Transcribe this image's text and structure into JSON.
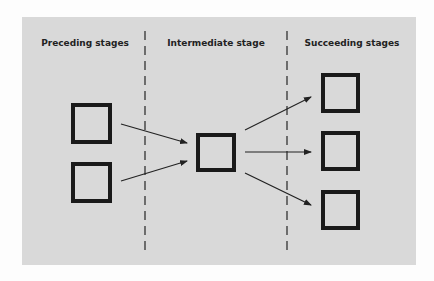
{
  "diagram": {
    "background_color": "#d9d9d9",
    "stages": [
      {
        "label": "Preceding stages",
        "center_x": 85
      },
      {
        "label": "Intermediate stage",
        "center_x": 216
      },
      {
        "label": "Succeeding stages",
        "center_x": 352
      }
    ],
    "dividers": [
      {
        "x": 145
      },
      {
        "x": 287
      }
    ],
    "boxes": [
      {
        "id": "preceding-1",
        "x": 71,
        "y": 103,
        "w": 41,
        "h": 41
      },
      {
        "id": "preceding-2",
        "x": 71,
        "y": 162,
        "w": 41,
        "h": 41
      },
      {
        "id": "intermediate",
        "x": 196,
        "y": 133,
        "w": 40,
        "h": 39
      },
      {
        "id": "succeeding-1",
        "x": 321,
        "y": 73,
        "w": 39,
        "h": 40
      },
      {
        "id": "succeeding-2",
        "x": 321,
        "y": 131,
        "w": 39,
        "h": 40
      },
      {
        "id": "succeeding-3",
        "x": 321,
        "y": 190,
        "w": 39,
        "h": 40
      }
    ],
    "arrows": [
      {
        "from": "preceding-1",
        "to": "intermediate",
        "x1": 121,
        "y1": 124,
        "x2": 187,
        "y2": 143
      },
      {
        "from": "preceding-2",
        "to": "intermediate",
        "x1": 121,
        "y1": 181,
        "x2": 187,
        "y2": 161
      },
      {
        "from": "intermediate",
        "to": "succeeding-1",
        "x1": 245,
        "y1": 130,
        "x2": 311,
        "y2": 97
      },
      {
        "from": "intermediate",
        "to": "succeeding-2",
        "x1": 245,
        "y1": 152,
        "x2": 311,
        "y2": 152
      },
      {
        "from": "intermediate",
        "to": "succeeding-3",
        "x1": 245,
        "y1": 173,
        "x2": 311,
        "y2": 205
      }
    ]
  }
}
